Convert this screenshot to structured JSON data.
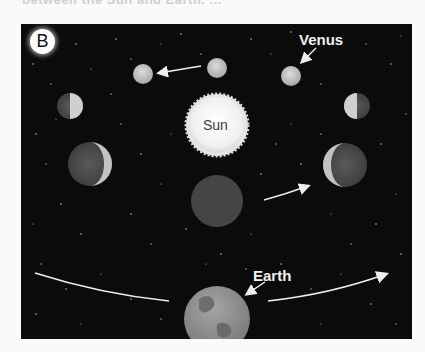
{
  "figure": {
    "cutoff_caption": "between the Sun and Earth. ...",
    "panel_label": "B",
    "labels": {
      "sun": "Sun",
      "venus": "Venus",
      "earth": "Earth"
    },
    "colors": {
      "background": "#0b0b0b",
      "sun": "#f4f4f4",
      "planet": "#c9c9c9",
      "venus_dim": "#4a4a4a",
      "earth": "#8c8c8c",
      "arrow": "#eeeeee"
    },
    "venus_phases": [
      {
        "position": "top-left",
        "phase": "gibbous-full"
      },
      {
        "position": "top-center",
        "phase": "full"
      },
      {
        "position": "top-right",
        "phase": "gibbous-full"
      },
      {
        "position": "upper-left",
        "phase": "half-lit-right"
      },
      {
        "position": "upper-right",
        "phase": "half-lit-left"
      },
      {
        "position": "middle-left",
        "phase": "crescent-lit-right"
      },
      {
        "position": "middle-right",
        "phase": "crescent-lit-left"
      },
      {
        "position": "bottom-center",
        "phase": "new"
      }
    ]
  }
}
